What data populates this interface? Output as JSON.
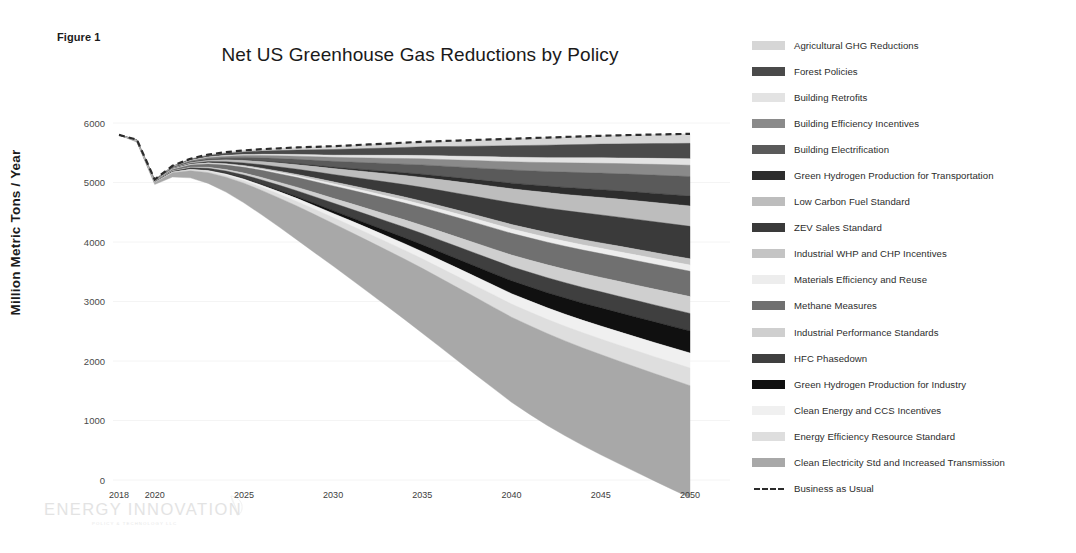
{
  "figure": {
    "caption": "Figure 1",
    "title": "Net US Greenhouse Gas Reductions by Policy"
  },
  "watermark": {
    "name": "ENERGY INNOVATION",
    "tagline": "POLICY & TECHNOLOGY LLC"
  },
  "axes": {
    "ylabel": "Million Metric Tons / Year",
    "yticks": [
      "0",
      "1000",
      "2000",
      "3000",
      "4000",
      "5000",
      "6000"
    ],
    "xticks": [
      "2018",
      "2020",
      "2025",
      "2030",
      "2035",
      "2040",
      "2045",
      "2050"
    ]
  },
  "legend": {
    "items": [
      {
        "label": "Agricultural GHG Reductions",
        "color": "#d6d6d6"
      },
      {
        "label": "Forest Policies",
        "color": "#4a4a4a"
      },
      {
        "label": "Building Retrofits",
        "color": "#e3e3e3"
      },
      {
        "label": "Building Efficiency Incentives",
        "color": "#8a8a8a"
      },
      {
        "label": "Building Electrification",
        "color": "#5a5a5a"
      },
      {
        "label": "Green Hydrogen Production for Transportation",
        "color": "#2d2d2d"
      },
      {
        "label": "Low Carbon Fuel Standard",
        "color": "#bdbdbd"
      },
      {
        "label": "ZEV Sales Standard",
        "color": "#3a3a3a"
      },
      {
        "label": "Industrial WHP and CHP Incentives",
        "color": "#c4c4c4"
      },
      {
        "label": "Materials Efficiency and Reuse",
        "color": "#ededed"
      },
      {
        "label": "Methane Measures",
        "color": "#707070"
      },
      {
        "label": "Industrial Performance Standards",
        "color": "#cfcfcf"
      },
      {
        "label": "HFC Phasedown",
        "color": "#3f3f3f"
      },
      {
        "label": "Green Hydrogen Production for Industry",
        "color": "#101010"
      },
      {
        "label": "Clean Energy and CCS Incentives",
        "color": "#f0f0f0"
      },
      {
        "label": "Energy Efficiency Resource Standard",
        "color": "#dedede"
      },
      {
        "label": "Clean Electricity Std and Increased Transmission",
        "color": "#a8a8a8"
      },
      {
        "label": "Business as Usual",
        "color": "#2b2b2b",
        "style": "dashed-line"
      }
    ]
  },
  "chart_data": {
    "type": "area",
    "title": "Net US Greenhouse Gas Reductions by Policy",
    "xlabel": "",
    "ylabel": "Million Metric Tons / Year",
    "xlim": [
      2018,
      2050
    ],
    "ylim": [
      0,
      6000
    ],
    "grid": false,
    "legend_position": "right",
    "stacked": true,
    "stack_order": "top-down-from-baseline",
    "x": [
      2018,
      2019,
      2020,
      2021,
      2022,
      2023,
      2024,
      2025,
      2026,
      2027,
      2028,
      2029,
      2030,
      2031,
      2032,
      2033,
      2034,
      2035,
      2036,
      2037,
      2038,
      2039,
      2040,
      2041,
      2042,
      2043,
      2044,
      2045,
      2046,
      2047,
      2048,
      2049,
      2050
    ],
    "business_as_usual": {
      "name": "Business as Usual",
      "values": [
        5800,
        5720,
        5050,
        5280,
        5400,
        5470,
        5510,
        5540,
        5560,
        5575,
        5590,
        5600,
        5610,
        5625,
        5640,
        5655,
        5670,
        5685,
        5695,
        5705,
        5715,
        5725,
        5735,
        5745,
        5755,
        5765,
        5775,
        5785,
        5793,
        5800,
        5806,
        5812,
        5818
      ]
    },
    "net_emissions": {
      "name": "Net Emissions After All Policies",
      "values": [
        5800,
        5720,
        5050,
        5180,
        5080,
        4930,
        4780,
        4620,
        4460,
        4320,
        4190,
        4080,
        3990,
        3880,
        3740,
        3570,
        3390,
        3190,
        2990,
        2790,
        2580,
        2370,
        2100,
        1880,
        1720,
        1600,
        1500,
        1410,
        1320,
        1230,
        1130,
        1010,
        880
      ],
      "note": "upper boundary of the lowest (Clean Electricity) band"
    },
    "series": [
      {
        "name": "Agricultural GHG Reductions",
        "color": "#d6d6d6",
        "values": [
          0,
          2,
          3,
          6,
          10,
          15,
          20,
          26,
          32,
          38,
          44,
          50,
          56,
          62,
          68,
          74,
          80,
          86,
          92,
          98,
          104,
          110,
          116,
          122,
          127,
          132,
          136,
          140,
          144,
          148,
          152,
          156,
          160
        ]
      },
      {
        "name": "Forest Policies",
        "color": "#4a4a4a",
        "values": [
          0,
          3,
          5,
          10,
          17,
          25,
          34,
          44,
          54,
          64,
          74,
          84,
          94,
          104,
          114,
          124,
          134,
          144,
          154,
          164,
          174,
          184,
          194,
          202,
          210,
          217,
          224,
          230,
          236,
          242,
          248,
          254,
          260
        ]
      },
      {
        "name": "Building Retrofits",
        "color": "#e3e3e3",
        "values": [
          0,
          1,
          2,
          4,
          7,
          10,
          13,
          17,
          21,
          25,
          29,
          33,
          37,
          41,
          45,
          49,
          53,
          57,
          61,
          65,
          69,
          73,
          77,
          80,
          83,
          86,
          89,
          92,
          95,
          98,
          101,
          104,
          107
        ]
      },
      {
        "name": "Building Efficiency Incentives",
        "color": "#8a8a8a",
        "values": [
          0,
          2,
          4,
          8,
          13,
          19,
          25,
          32,
          39,
          46,
          53,
          60,
          67,
          74,
          81,
          88,
          95,
          102,
          109,
          116,
          123,
          130,
          137,
          143,
          149,
          155,
          160,
          165,
          170,
          175,
          180,
          185,
          190
        ]
      },
      {
        "name": "Building Electrification",
        "color": "#5a5a5a",
        "values": [
          0,
          2,
          4,
          9,
          15,
          23,
          32,
          42,
          52,
          63,
          74,
          85,
          96,
          108,
          120,
          132,
          144,
          157,
          170,
          183,
          196,
          209,
          222,
          234,
          246,
          257,
          268,
          278,
          288,
          298,
          308,
          318,
          328
        ]
      },
      {
        "name": "Green Hydrogen Production for Transportation",
        "color": "#2d2d2d",
        "values": [
          0,
          0,
          0,
          1,
          2,
          3,
          5,
          7,
          10,
          13,
          16,
          20,
          24,
          29,
          34,
          40,
          46,
          53,
          60,
          68,
          76,
          85,
          94,
          102,
          110,
          118,
          125,
          132,
          139,
          146,
          153,
          160,
          167
        ]
      },
      {
        "name": "Low Carbon Fuel Standard",
        "color": "#bdbdbd",
        "values": [
          0,
          2,
          4,
          9,
          16,
          24,
          33,
          43,
          54,
          65,
          77,
          89,
          101,
          114,
          127,
          140,
          153,
          167,
          181,
          195,
          209,
          223,
          237,
          249,
          261,
          272,
          283,
          293,
          303,
          313,
          323,
          333,
          343
        ]
      },
      {
        "name": "ZEV Sales Standard",
        "color": "#3a3a3a",
        "values": [
          0,
          1,
          3,
          7,
          13,
          21,
          31,
          43,
          57,
          72,
          88,
          105,
          123,
          143,
          164,
          186,
          209,
          233,
          258,
          284,
          310,
          337,
          364,
          388,
          411,
          432,
          452,
          470,
          487,
          503,
          518,
          532,
          545
        ]
      },
      {
        "name": "Industrial WHP and CHP Incentives",
        "color": "#c4c4c4",
        "values": [
          0,
          1,
          2,
          4,
          6,
          9,
          12,
          15,
          19,
          23,
          27,
          31,
          35,
          39,
          43,
          47,
          51,
          55,
          59,
          63,
          67,
          71,
          75,
          78,
          81,
          84,
          87,
          90,
          93,
          96,
          99,
          102,
          105
        ]
      },
      {
        "name": "Materials Efficiency and Reuse",
        "color": "#ededed",
        "values": [
          0,
          1,
          2,
          4,
          6,
          9,
          12,
          15,
          18,
          22,
          26,
          30,
          34,
          38,
          42,
          46,
          50,
          54,
          58,
          62,
          66,
          70,
          74,
          77,
          80,
          83,
          86,
          89,
          92,
          95,
          98,
          101,
          104
        ]
      },
      {
        "name": "Methane Measures",
        "color": "#707070",
        "values": [
          0,
          5,
          10,
          22,
          38,
          56,
          76,
          98,
          120,
          142,
          164,
          186,
          208,
          228,
          248,
          266,
          283,
          299,
          314,
          328,
          341,
          353,
          364,
          373,
          381,
          388,
          395,
          401,
          407,
          412,
          417,
          422,
          427
        ]
      },
      {
        "name": "Industrial Performance Standards",
        "color": "#cfcfcf",
        "values": [
          0,
          1,
          3,
          6,
          11,
          17,
          24,
          32,
          41,
          50,
          60,
          70,
          80,
          91,
          102,
          113,
          124,
          136,
          148,
          160,
          172,
          184,
          196,
          206,
          216,
          225,
          234,
          242,
          250,
          258,
          266,
          274,
          282
        ]
      },
      {
        "name": "HFC Phasedown",
        "color": "#3f3f3f",
        "values": [
          0,
          3,
          6,
          13,
          22,
          33,
          45,
          58,
          72,
          86,
          100,
          114,
          128,
          141,
          154,
          166,
          178,
          189,
          200,
          210,
          220,
          229,
          238,
          245,
          252,
          258,
          264,
          270,
          275,
          280,
          285,
          290,
          295
        ]
      },
      {
        "name": "Green Hydrogen Production for Industry",
        "color": "#101010",
        "values": [
          0,
          0,
          0,
          1,
          2,
          4,
          7,
          11,
          16,
          22,
          29,
          37,
          46,
          57,
          69,
          83,
          98,
          115,
          133,
          152,
          172,
          193,
          215,
          235,
          254,
          272,
          289,
          305,
          320,
          334,
          347,
          359,
          370
        ]
      },
      {
        "name": "Clean Energy and CCS Incentives",
        "color": "#f0f0f0",
        "values": [
          0,
          1,
          2,
          5,
          9,
          14,
          20,
          27,
          35,
          43,
          52,
          61,
          70,
          80,
          90,
          100,
          110,
          121,
          132,
          143,
          154,
          165,
          176,
          185,
          194,
          202,
          210,
          217,
          224,
          231,
          238,
          245,
          252
        ]
      },
      {
        "name": "Energy Efficiency Resource Standard",
        "color": "#dedede",
        "values": [
          0,
          2,
          4,
          9,
          15,
          23,
          32,
          42,
          53,
          64,
          76,
          88,
          100,
          112,
          124,
          136,
          148,
          160,
          172,
          184,
          196,
          208,
          220,
          229,
          238,
          246,
          254,
          262,
          269,
          276,
          283,
          290,
          297
        ]
      },
      {
        "name": "Clean Electricity Std and Increased Transmission",
        "color": "#a8a8a8",
        "values": [
          0,
          15,
          30,
          70,
          120,
          180,
          250,
          330,
          410,
          490,
          570,
          645,
          715,
          790,
          865,
          940,
          1015,
          1090,
          1160,
          1230,
          1300,
          1365,
          1430,
          1490,
          1545,
          1595,
          1640,
          1685,
          1725,
          1765,
          1805,
          1845,
          1885
        ]
      }
    ]
  }
}
